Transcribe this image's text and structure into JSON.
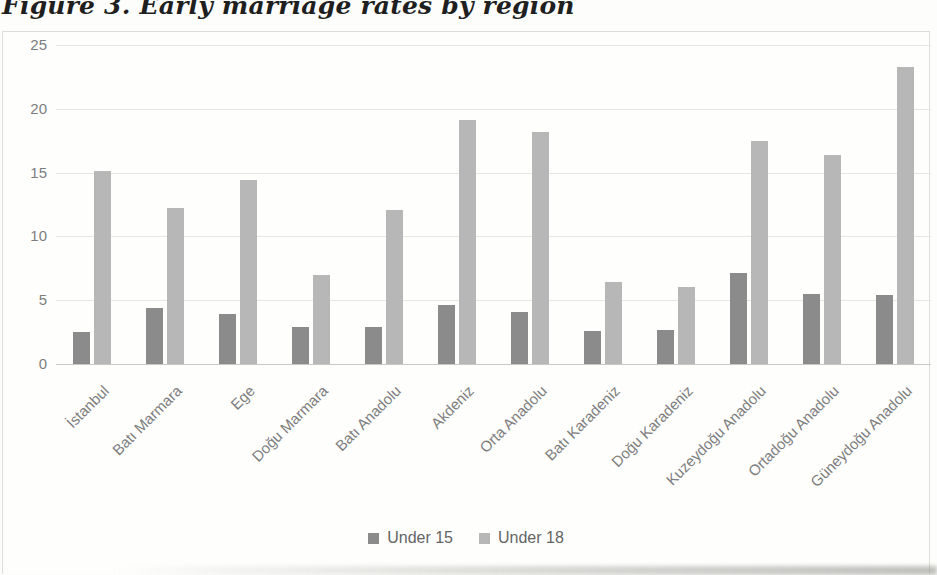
{
  "title": "Figure 3. Early marriage rates by region",
  "colors": {
    "series_under_15": "#8b8b8b",
    "series_under_18": "#b7b7b7",
    "axis_text": "#7d7d7d",
    "gridline": "#e6e6e3"
  },
  "chart_data": {
    "type": "bar",
    "title": "Figure 3. Early marriage rates by region",
    "categories": [
      "İstanbul",
      "Batı Marmara",
      "Ege",
      "Doğu Marmara",
      "Batı Anadolu",
      "Akdeniz",
      "Orta Anadolu",
      "Batı Karadeniz",
      "Doğu Karadeniz",
      "Kuzeydoğu Anadolu",
      "Ortadoğu Anadolu",
      "Güneydoğu Anadolu"
    ],
    "series": [
      {
        "name": "Under 15",
        "color": "#8b8b8b",
        "values": [
          2.5,
          4.4,
          3.9,
          2.9,
          2.9,
          4.6,
          4.1,
          2.6,
          2.7,
          7.1,
          5.5,
          5.4
        ]
      },
      {
        "name": "Under 18",
        "color": "#b7b7b7",
        "values": [
          15.1,
          12.2,
          14.4,
          7.0,
          12.1,
          19.1,
          18.2,
          6.4,
          6.0,
          17.5,
          16.4,
          23.3
        ]
      }
    ],
    "xlabel": "",
    "ylabel": "",
    "ylim": [
      0,
      25
    ],
    "yticks": [
      0,
      5,
      10,
      15,
      20,
      25
    ],
    "grid": true,
    "legend_position": "bottom"
  }
}
